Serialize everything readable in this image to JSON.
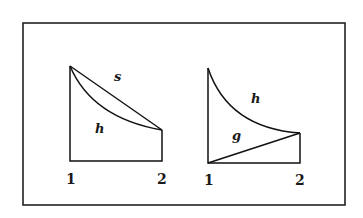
{
  "figure": {
    "frame": {
      "x": 22,
      "y": 22,
      "width": 324,
      "height": 184
    },
    "left_diagram": {
      "label_top": "s",
      "label_inside": "h",
      "x_label_start": "1",
      "x_label_end": "2"
    },
    "right_diagram": {
      "label_top": "h",
      "label_inside": "g",
      "x_label_start": "1",
      "x_label_end": "2"
    }
  }
}
